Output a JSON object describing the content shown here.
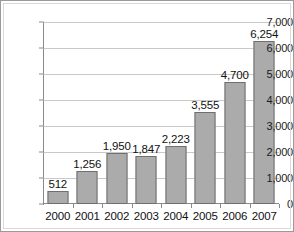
{
  "chart_data": {
    "type": "bar",
    "title": "",
    "subtitle": "",
    "xlabel": "",
    "ylabel": "",
    "categories": [
      "2000",
      "2001",
      "2002",
      "2003",
      "2004",
      "2005",
      "2006",
      "2007"
    ],
    "values": [
      512,
      1256,
      1950,
      1847,
      2223,
      3555,
      4700,
      6254
    ],
    "value_labels": [
      "512",
      "1,256",
      "1,950",
      "1,847",
      "2,223",
      "3,555",
      "4,700",
      "6,254"
    ],
    "ylim": [
      0,
      7000
    ],
    "ytick_values": [
      0,
      1000,
      2000,
      3000,
      4000,
      5000,
      6000,
      7000
    ],
    "ytick_labels": [
      "0",
      "1,000",
      "2,000",
      "3,000",
      "4,000",
      "5,000",
      "6,000",
      "7,000"
    ],
    "grid": true,
    "legend": null,
    "legend_position": "none",
    "series": [
      {
        "name": "",
        "values": [
          512,
          1256,
          1950,
          1847,
          2223,
          3555,
          4700,
          6254
        ]
      }
    ],
    "colors": {
      "bar_fill": "#ababab",
      "bar_border": "#6f6f6f",
      "gridline": "#c9c9c9",
      "axis": "#8a8a8a",
      "text": "#111111",
      "frame": "#9a9a9a",
      "background": "#ffffff"
    }
  }
}
